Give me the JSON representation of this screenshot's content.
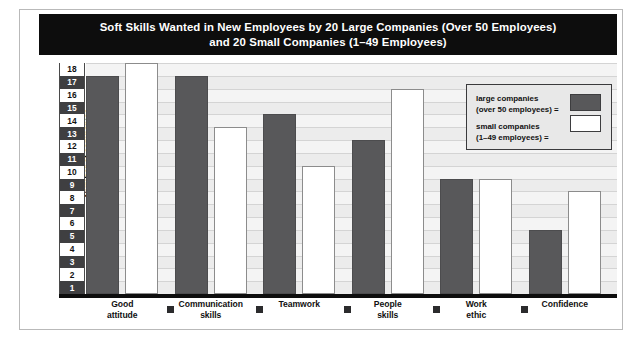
{
  "chart_data": {
    "type": "bar",
    "title": "Soft Skills Wanted in New Employees by 20 Large Companies (Over 50 Employees) and 20 Small Companies (1–49 Employees)",
    "title_line1": "Soft Skills Wanted in New Employees by 20 Large Companies (Over 50 Employees)",
    "title_line2": "and 20 Small Companies (1–49 Employees)",
    "xlabel": "",
    "ylabel": "Number of companies",
    "ylim": [
      0,
      18
    ],
    "ytick_labels": [
      "1",
      "2",
      "3",
      "4",
      "5",
      "6",
      "7",
      "8",
      "9",
      "10",
      "11",
      "12",
      "13",
      "14",
      "15",
      "16",
      "17",
      "18"
    ],
    "grid": true,
    "legend_position": "upper-right",
    "categories": [
      "Good attitude",
      "Communication skills",
      "Teamwork",
      "People skills",
      "Work ethic",
      "Confidence"
    ],
    "category_lines": [
      [
        "Good",
        "attitude"
      ],
      [
        "Communication",
        "skills"
      ],
      [
        "Teamwork",
        ""
      ],
      [
        "People",
        "skills"
      ],
      [
        "Work",
        "ethic"
      ],
      [
        "Confidence",
        ""
      ]
    ],
    "series": [
      {
        "name": "large companies (over 50 employees)",
        "color": "#58585a",
        "values": [
          17,
          17,
          14,
          12,
          9,
          5
        ]
      },
      {
        "name": "small companies (1–49 employees)",
        "color": "#ffffff",
        "values": [
          18,
          13,
          10,
          16,
          9,
          8
        ]
      }
    ]
  },
  "legend": {
    "large_line1": "large companies",
    "large_line2": "(over 50 employees) =",
    "small_line1": "small companies",
    "small_line2": "(1–49 employees) ="
  },
  "colors": {
    "title_background": "#0d0d0d",
    "title_text": "#ffffff",
    "large_bar": "#58585a",
    "small_bar": "#ffffff",
    "plot_background": "#f4f4f4",
    "gridline": "#d4d4d4",
    "axis": "#0d0d0d",
    "tick_odd_background": "#3f3f41",
    "legend_background": "#e8e8e8"
  }
}
